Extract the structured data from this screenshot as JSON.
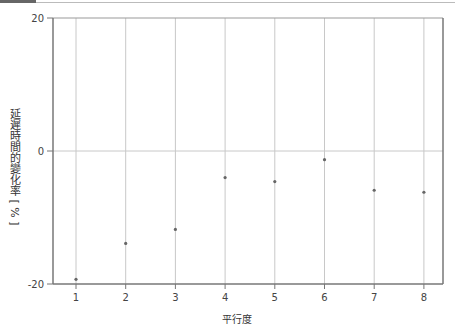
{
  "caption": "(cut-off caption text above chart)",
  "chart_data": {
    "type": "scatter",
    "title": "",
    "xlabel": "平行度",
    "ylabel": "延遲時間的變化率 [ % ]",
    "x": [
      1,
      2,
      3,
      4,
      5,
      6,
      7,
      8
    ],
    "series": [
      {
        "name": "延遲時間的變化率",
        "values": [
          -19.3,
          -13.9,
          -11.8,
          -4.0,
          -4.6,
          -1.3,
          -5.9,
          -6.2
        ]
      }
    ],
    "xticks": [
      "1",
      "2",
      "3",
      "4",
      "5",
      "6",
      "7",
      "8"
    ],
    "yticks": [
      "20",
      "0",
      "-20"
    ],
    "xlim": [
      0.55,
      8.4
    ],
    "ylim": [
      -20,
      20
    ],
    "grid": {
      "vertical": true,
      "horizontal_zero_line": true
    },
    "legend": null,
    "colors": {
      "point": "#666666",
      "grid": "#c8c8c8",
      "frame": "#777777"
    }
  },
  "axes": {
    "xlabel": "平行度",
    "ylabel": "延遲時間的變化率 [ % ]",
    "ytick_top": "20",
    "ytick_mid": "0",
    "ytick_bottom": "-20",
    "xticks": [
      "1",
      "2",
      "3",
      "4",
      "5",
      "6",
      "7",
      "8"
    ]
  }
}
